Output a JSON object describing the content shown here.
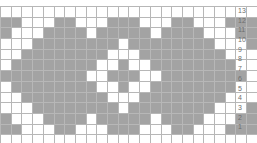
{
  "chart_data": {
    "type": "heatmap",
    "title": "",
    "xlabel": "",
    "ylabel": "",
    "columns": 24,
    "rows": 13,
    "legend": [
      {
        "name": "filled-stitch",
        "color": "#a3a3a3",
        "value": 1
      },
      {
        "name": "empty-stitch",
        "color": "#ffffff",
        "value": 0
      }
    ],
    "grid": true,
    "grid_color": "#b7b7b7",
    "row_labels_position": "right",
    "row_labels": [
      "13",
      "12",
      "11",
      "10",
      "9",
      "8",
      "7",
      "6",
      "5",
      "4",
      "3",
      "2",
      "1"
    ],
    "column_labels": [],
    "values": [
      [
        0,
        0,
        0,
        0,
        0,
        0,
        0,
        0,
        0,
        0,
        0,
        0,
        0,
        0,
        0,
        0,
        0,
        0,
        0,
        0,
        0,
        0,
        0,
        0
      ],
      [
        1,
        1,
        0,
        0,
        0,
        1,
        1,
        0,
        0,
        0,
        1,
        1,
        1,
        0,
        0,
        0,
        1,
        1,
        0,
        0,
        0,
        1,
        1,
        1
      ],
      [
        1,
        0,
        0,
        0,
        1,
        1,
        1,
        1,
        0,
        1,
        1,
        1,
        1,
        1,
        0,
        1,
        1,
        1,
        1,
        0,
        0,
        0,
        1,
        1
      ],
      [
        0,
        0,
        0,
        1,
        1,
        1,
        1,
        1,
        1,
        1,
        1,
        0,
        1,
        1,
        1,
        1,
        1,
        1,
        1,
        1,
        0,
        0,
        0,
        1
      ],
      [
        0,
        0,
        1,
        1,
        1,
        1,
        1,
        1,
        1,
        1,
        0,
        0,
        0,
        1,
        1,
        1,
        1,
        1,
        1,
        1,
        1,
        0,
        0,
        0
      ],
      [
        0,
        1,
        1,
        1,
        1,
        1,
        1,
        1,
        1,
        0,
        0,
        1,
        0,
        0,
        1,
        1,
        1,
        1,
        1,
        1,
        1,
        1,
        0,
        0
      ],
      [
        1,
        1,
        1,
        1,
        1,
        1,
        1,
        1,
        0,
        0,
        1,
        1,
        1,
        0,
        0,
        1,
        1,
        1,
        1,
        1,
        1,
        1,
        1,
        0
      ],
      [
        0,
        1,
        1,
        1,
        1,
        1,
        1,
        1,
        1,
        0,
        0,
        1,
        0,
        0,
        1,
        1,
        1,
        1,
        1,
        1,
        1,
        1,
        0,
        0
      ],
      [
        0,
        0,
        1,
        1,
        1,
        1,
        1,
        1,
        1,
        1,
        0,
        0,
        0,
        1,
        1,
        1,
        1,
        1,
        1,
        1,
        1,
        0,
        0,
        0
      ],
      [
        0,
        0,
        0,
        1,
        1,
        1,
        1,
        1,
        1,
        1,
        1,
        0,
        1,
        1,
        1,
        1,
        1,
        1,
        1,
        1,
        0,
        0,
        0,
        1
      ],
      [
        1,
        0,
        0,
        0,
        1,
        1,
        1,
        1,
        0,
        1,
        1,
        1,
        1,
        1,
        0,
        1,
        1,
        1,
        1,
        0,
        0,
        0,
        1,
        1
      ],
      [
        1,
        1,
        0,
        0,
        0,
        1,
        1,
        0,
        0,
        0,
        1,
        1,
        1,
        0,
        0,
        0,
        1,
        1,
        0,
        0,
        0,
        1,
        1,
        1
      ],
      [
        0,
        0,
        0,
        0,
        0,
        0,
        0,
        0,
        0,
        0,
        0,
        0,
        0,
        0,
        0,
        0,
        0,
        0,
        0,
        0,
        0,
        0,
        0,
        0
      ]
    ]
  }
}
